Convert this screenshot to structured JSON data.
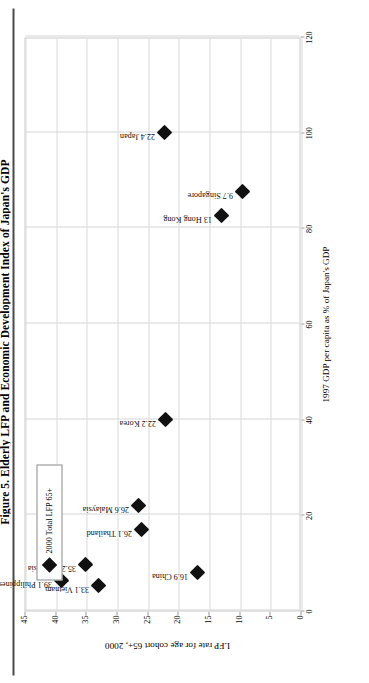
{
  "figure": {
    "title": "Figure 5. Elderly LFP and Economic Development Index of Japan's GDP",
    "legend_label": "2000 Total LFP 65+",
    "legend_marker": "diamond-marker"
  },
  "chart_data": {
    "type": "scatter",
    "title": "Figure 5. Elderly LFP and Economic Development Index of Japan's GDP",
    "xlabel": "1997 GDP per capita as % of Japan's GDP",
    "ylabel": "LFP rate for age cohort 65+, 2000",
    "xlim": [
      0,
      120
    ],
    "ylim": [
      0,
      45
    ],
    "xticks": [
      0,
      20,
      40,
      60,
      80,
      100,
      120
    ],
    "yticks": [
      0,
      5,
      10,
      15,
      20,
      25,
      30,
      35,
      40,
      45
    ],
    "grid": true,
    "legend_position": "top-left",
    "series": [
      {
        "name": "2000 Total LFP 65+",
        "marker": "diamond",
        "color": "#111111",
        "points": [
          {
            "label": "39.1 Philippines",
            "country": "Philippines",
            "x": 6.2,
            "y": 39.1
          },
          {
            "label": "35.2 Indonesia",
            "country": "Indonesia",
            "x": 9.6,
            "y": 35.2
          },
          {
            "label": "33.1 Vietnam",
            "country": "Vietnam",
            "x": 5.2,
            "y": 33.1
          },
          {
            "label": "26.6 Malaysia",
            "country": "Malaysia",
            "x": 22.0,
            "y": 26.6
          },
          {
            "label": "26.1 Thailand",
            "country": "Thailand",
            "x": 17.0,
            "y": 26.1
          },
          {
            "label": "22.2 Korea",
            "country": "Korea",
            "x": 40.0,
            "y": 22.2
          },
          {
            "label": "22.4 Japan",
            "country": "Japan",
            "x": 100.0,
            "y": 22.4
          },
          {
            "label": "16.9 China",
            "country": "China",
            "x": 8.0,
            "y": 16.9
          },
          {
            "label": "13 Hong Kong",
            "country": "Hong Kong",
            "x": 82.5,
            "y": 13.0
          },
          {
            "label": "9.7 Singapore",
            "country": "Singapore",
            "x": 87.5,
            "y": 9.7
          }
        ]
      }
    ]
  }
}
